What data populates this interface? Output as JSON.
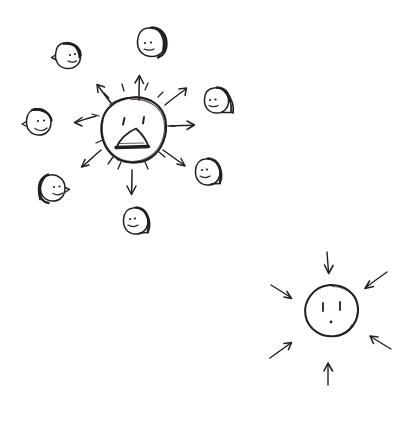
{
  "image": {
    "kind": "hand-drawn-sketch",
    "title": "Shouting face broadcasting to many heads; calm face receiving arrows",
    "background_color": "#ffffff",
    "ink_color": "#231f20",
    "width": 414,
    "height": 439,
    "text_labels": []
  },
  "scenes": [
    {
      "id": "broadcast-scene",
      "name": "broadcast-scene",
      "description": "Large shouting face at center with arrows radiating outward toward surrounding heads",
      "center": {
        "x": 133,
        "y": 128
      }
    },
    {
      "id": "receiving-scene",
      "name": "receiving-scene",
      "description": "Calm face with arrows pointing inward from all directions",
      "center": {
        "x": 330,
        "y": 313
      }
    }
  ],
  "shouting_face": {
    "name": "shouting-face",
    "cx": 133,
    "cy": 128,
    "rx": 30,
    "ry": 31,
    "expression": "shouting",
    "eyes": 2,
    "mouth": "open-triangle",
    "sunburst_ticks": 10
  },
  "calm_face": {
    "name": "calm-face",
    "cx": 330,
    "cy": 313,
    "rx": 28,
    "ry": 28,
    "expression": "neutral",
    "eyes": 2,
    "mouth": "dot"
  },
  "outgoing_arrows": [
    {
      "id": "arrow-out-n",
      "angle_deg": -90,
      "label": "up"
    },
    {
      "id": "arrow-out-ne",
      "angle_deg": -45,
      "label": "up-right"
    },
    {
      "id": "arrow-out-e",
      "angle_deg": 0,
      "label": "right"
    },
    {
      "id": "arrow-out-se",
      "angle_deg": 40,
      "label": "down-right"
    },
    {
      "id": "arrow-out-s",
      "angle_deg": 90,
      "label": "down"
    },
    {
      "id": "arrow-out-sw",
      "angle_deg": 140,
      "label": "down-left"
    },
    {
      "id": "arrow-out-w",
      "angle_deg": 188,
      "label": "left"
    },
    {
      "id": "arrow-out-nw",
      "angle_deg": -132,
      "label": "up-left"
    }
  ],
  "incoming_arrows": [
    {
      "id": "arrow-in-n",
      "angle_deg": -90,
      "label": "from-top"
    },
    {
      "id": "arrow-in-ne",
      "angle_deg": -40,
      "label": "from-top-right"
    },
    {
      "id": "arrow-in-e",
      "angle_deg": 18,
      "label": "from-right"
    },
    {
      "id": "arrow-in-s",
      "angle_deg": 90,
      "label": "from-bottom"
    },
    {
      "id": "arrow-in-sw",
      "angle_deg": 138,
      "label": "from-bottom-left"
    },
    {
      "id": "arrow-in-w",
      "angle_deg": 200,
      "label": "from-left"
    }
  ],
  "listener_heads": [
    {
      "id": "head-upper-left",
      "cx": 68,
      "cy": 55,
      "r": 13,
      "hair_side": "right",
      "facing": "left"
    },
    {
      "id": "head-top",
      "cx": 152,
      "cy": 42,
      "r": 14,
      "hair_side": "right",
      "facing": "left"
    },
    {
      "id": "head-upper-right",
      "cx": 219,
      "cy": 100,
      "r": 13,
      "hair_side": "right",
      "facing": "left"
    },
    {
      "id": "head-left",
      "cx": 39,
      "cy": 122,
      "r": 13,
      "hair_side": "top",
      "facing": "right"
    },
    {
      "id": "head-right",
      "cx": 209,
      "cy": 172,
      "r": 13,
      "hair_side": "right",
      "facing": "left"
    },
    {
      "id": "head-lower-left",
      "cx": 51,
      "cy": 188,
      "r": 13,
      "hair_side": "left",
      "facing": "right"
    },
    {
      "id": "head-bottom",
      "cx": 137,
      "cy": 221,
      "r": 13,
      "hair_side": "right",
      "facing": "left"
    }
  ]
}
